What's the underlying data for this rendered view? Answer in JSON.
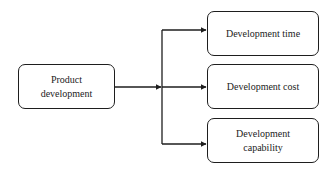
{
  "diagram": {
    "source": {
      "line1": "Product",
      "line2": "development"
    },
    "targets": [
      {
        "line1": "Development time",
        "line2": ""
      },
      {
        "line1": "Development cost",
        "line2": ""
      },
      {
        "line1": "Development",
        "line2": "capability"
      }
    ],
    "colors": {
      "stroke": "#1e1e1e",
      "background": "#ffffff",
      "text": "#222222"
    }
  }
}
